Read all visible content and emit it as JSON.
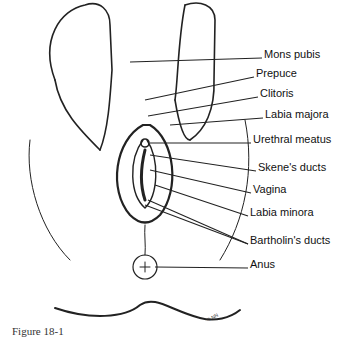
{
  "figure": {
    "caption": "Figure 18-1",
    "labels": [
      {
        "text": "Mons pubis",
        "x": 264,
        "y": 54
      },
      {
        "text": "Prepuce",
        "x": 256,
        "y": 73
      },
      {
        "text": "Clitoris",
        "x": 260,
        "y": 93
      },
      {
        "text": "Labia majora",
        "x": 265,
        "y": 114
      },
      {
        "text": "Urethral meatus",
        "x": 253,
        "y": 139
      },
      {
        "text": "Skene's ducts",
        "x": 258,
        "y": 167
      },
      {
        "text": "Vagina",
        "x": 253,
        "y": 189
      },
      {
        "text": "Labia minora",
        "x": 250,
        "y": 212
      },
      {
        "text": "Bartholin's ducts",
        "x": 250,
        "y": 240
      },
      {
        "text": "Anus",
        "x": 250,
        "y": 264
      }
    ],
    "copyright": "© NN"
  }
}
